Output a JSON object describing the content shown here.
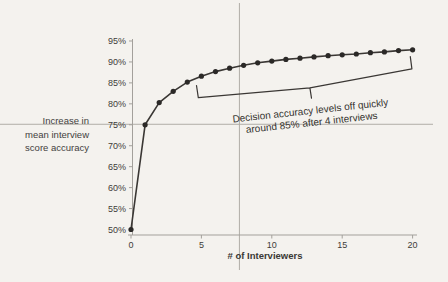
{
  "chart_data": {
    "type": "line",
    "title": "",
    "xlabel": "# of Interviewers",
    "ylabel_lines": [
      "Increase in",
      "mean interview",
      "score accuracy"
    ],
    "series_name": "Decision accuracy vs number of interviewers",
    "x": [
      0,
      1,
      2,
      3,
      4,
      5,
      6,
      7,
      8,
      9,
      10,
      11,
      12,
      13,
      14,
      15,
      16,
      17,
      18,
      19,
      20
    ],
    "values": [
      50,
      75,
      80.3,
      83.0,
      85.2,
      86.6,
      87.7,
      88.5,
      89.2,
      89.8,
      90.2,
      90.6,
      90.9,
      91.2,
      91.5,
      91.7,
      91.9,
      92.2,
      92.4,
      92.7,
      92.9
    ],
    "xticks": [
      {
        "value": 0,
        "label": "0"
      },
      {
        "value": 5,
        "label": "5"
      },
      {
        "value": 10,
        "label": "10"
      },
      {
        "value": 15,
        "label": "15"
      },
      {
        "value": 20,
        "label": "20"
      }
    ],
    "yticks": [
      {
        "value": 50,
        "label": "50%"
      },
      {
        "value": 55,
        "label": "55%"
      },
      {
        "value": 60,
        "label": "60%"
      },
      {
        "value": 65,
        "label": "65%"
      },
      {
        "value": 70,
        "label": "70%"
      },
      {
        "value": 75,
        "label": "75%"
      },
      {
        "value": 80,
        "label": "80%"
      },
      {
        "value": 85,
        "label": "85%"
      },
      {
        "value": 90,
        "label": "90%"
      },
      {
        "value": 95,
        "label": "95%"
      }
    ],
    "xlim": [
      0,
      20
    ],
    "ylim": [
      50,
      95
    ],
    "grid": false,
    "legend": "none",
    "annotation": {
      "line1": "Decision accuracy levels off quickly",
      "line2": "around 85% after 4 interviews"
    },
    "brace_span": {
      "from_x": 4.7,
      "to_x": 20
    },
    "reference_lines": {
      "horizontal_value": 75,
      "vertical_value": 7.7
    },
    "colors": {
      "background": "#f4f2ee",
      "line": "#3a3734",
      "dot": "#2b2927",
      "axis": "#a3a09b",
      "tick_text": "#3e3c39",
      "reference": "#b0ada7",
      "annotation": "#3a3734"
    }
  }
}
